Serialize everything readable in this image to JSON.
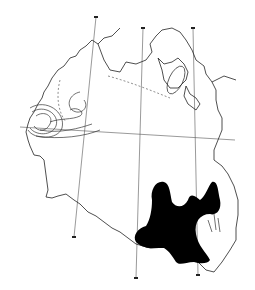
{
  "figure": {
    "type": "scanned outline map",
    "colors": {
      "background": "#ffffff",
      "line": "#222222",
      "shaded_region": "#000000"
    },
    "labels": []
  }
}
